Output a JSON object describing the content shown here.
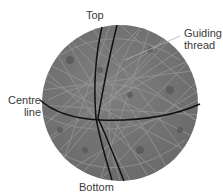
{
  "diagram": {
    "labels": {
      "top": "Top",
      "guiding_thread_line1": "Guiding",
      "guiding_thread_line2": "thread",
      "centre_line_line1": "Centre",
      "centre_line_line2": "line",
      "bottom": "Bottom"
    },
    "colors": {
      "sphere_fill": "#777777",
      "sphere_texture": "#999999",
      "sphere_dark_patches": "#555555",
      "lines": "#111111",
      "leader_line": "#aaaaaa",
      "label_text": "#3a3a3a"
    }
  }
}
